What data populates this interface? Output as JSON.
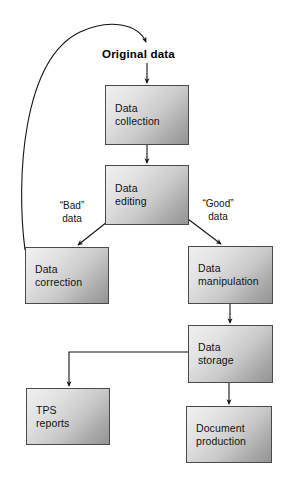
{
  "diagram": {
    "title": "Original data",
    "nodes": [
      {
        "id": "data-collection",
        "label": "Data\ncollection",
        "x": 105,
        "y": 85,
        "w": 84,
        "h": 60
      },
      {
        "id": "data-editing",
        "label": "Data\nediting",
        "x": 105,
        "y": 165,
        "w": 84,
        "h": 60
      },
      {
        "id": "data-correction",
        "label": "Data\ncorrection",
        "x": 25,
        "y": 247,
        "w": 84,
        "h": 57
      },
      {
        "id": "data-manipulation",
        "label": "Data\nmanipulation",
        "x": 188,
        "y": 246,
        "w": 85,
        "h": 58
      },
      {
        "id": "data-storage",
        "label": "Data\nstorage",
        "x": 188,
        "y": 325,
        "w": 85,
        "h": 58
      },
      {
        "id": "tps-reports",
        "label": "TPS\nreports",
        "x": 26,
        "y": 388,
        "w": 84,
        "h": 57
      },
      {
        "id": "document-production",
        "label": "Document\nproduction",
        "x": 186,
        "y": 406,
        "w": 86,
        "h": 57
      }
    ],
    "edge_labels": [
      {
        "id": "bad-data",
        "text": "“Bad”\ndata",
        "x": 50,
        "y": 200
      },
      {
        "id": "good-data",
        "text": "“Good”\ndata",
        "x": 193,
        "y": 198
      }
    ],
    "colors": {
      "box_border": "#4a4a4a",
      "box_fill_light": "#f0f0f0",
      "box_fill_dark": "#949494",
      "connector": "#1a1a1a",
      "text": "#121212",
      "background": "#ffffff"
    }
  }
}
